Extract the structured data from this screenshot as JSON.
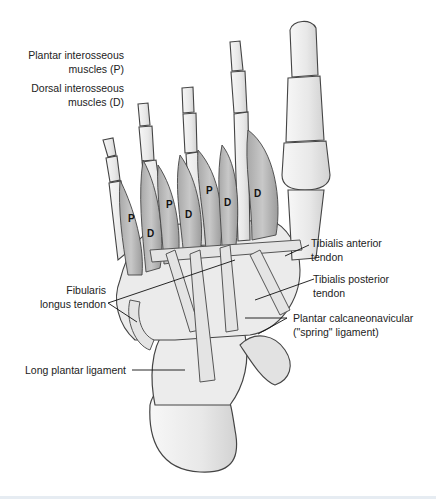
{
  "figure": {
    "view": "Plantar view of right foot (bones, interosseous muscles, tendons and ligaments)",
    "labels": {
      "plantar_interosseous": {
        "line1": "Plantar interosseous",
        "line2": "muscles (P)"
      },
      "dorsal_interosseous": {
        "line1": "Dorsal interosseous",
        "line2": "muscles (D)"
      },
      "tibialis_anterior": {
        "line1": "Tibialis anterior",
        "line2": "tendon"
      },
      "tibialis_posterior": {
        "line1": "Tibialis posterior",
        "line2": "tendon"
      },
      "fibularis_longus": {
        "line1": "Fibularis",
        "line2": "longus tendon"
      },
      "spring_ligament": {
        "line1": "Plantar calcaneonavicular",
        "line2": "(\"spring\" ligament)"
      },
      "long_plantar": {
        "line1": "Long plantar ligament"
      }
    },
    "muscle_markers": [
      {
        "letter": "P",
        "x": 133,
        "y": 218
      },
      {
        "letter": "D",
        "x": 152,
        "y": 233
      },
      {
        "letter": "P",
        "x": 171,
        "y": 204
      },
      {
        "letter": "D",
        "x": 190,
        "y": 214
      },
      {
        "letter": "P",
        "x": 211,
        "y": 190
      },
      {
        "letter": "D",
        "x": 229,
        "y": 202
      },
      {
        "letter": "D",
        "x": 259,
        "y": 193
      }
    ],
    "colors": {
      "bone_fill": "#eeeeee",
      "bone_stroke": "#444444",
      "muscle_fill": "#b9b9b9",
      "tendon_fill": "#e4e4e4",
      "label_text": "#222222",
      "leader_line": "#111111"
    }
  }
}
